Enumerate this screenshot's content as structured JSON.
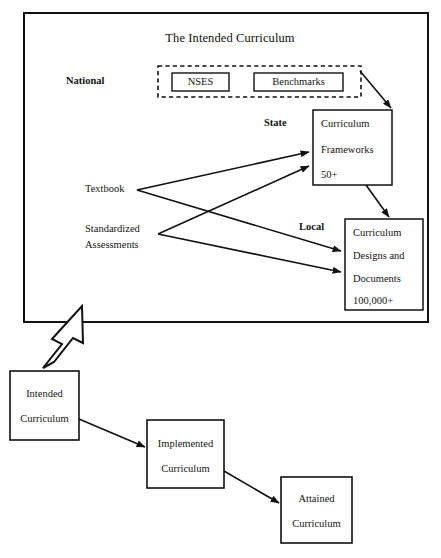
{
  "figure": {
    "title": "The Intended Curriculum",
    "width": 441,
    "height": 558,
    "background": "#ffffff",
    "stroke_color": "#111111"
  },
  "tiers": {
    "national_label": "National",
    "state_label": "State",
    "local_label": "Local"
  },
  "national_group": {
    "boxes": [
      {
        "label": "NSES"
      },
      {
        "label": "Benchmarks"
      }
    ]
  },
  "state_box": {
    "lines": [
      "Curriculum",
      "Frameworks",
      "50+"
    ]
  },
  "local_box": {
    "lines": [
      "Curriculum",
      "Designs and",
      "Documents",
      "100,000+"
    ]
  },
  "inputs": [
    {
      "label": "Textbook"
    },
    {
      "label_line1": "Standardized",
      "label_line2": "Assessments"
    }
  ],
  "flow_boxes": [
    {
      "line1": "Intended",
      "line2": "Curriculum"
    },
    {
      "line1": "Implemented",
      "line2": "Curriculum"
    },
    {
      "line1": "Attained",
      "line2": "Curriculum"
    }
  ]
}
